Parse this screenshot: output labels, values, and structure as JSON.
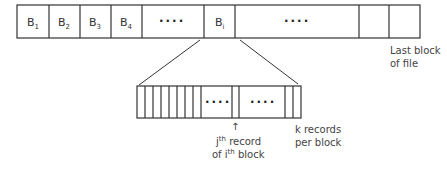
{
  "file_blocks": {
    "cells": [
      {
        "x": 17,
        "w": 32,
        "label": "B",
        "sub": "1"
      },
      {
        "x": 49,
        "w": 31,
        "label": "B",
        "sub": "2"
      },
      {
        "x": 80,
        "w": 31,
        "label": "B",
        "sub": "3"
      },
      {
        "x": 111,
        "w": 31,
        "label": "B",
        "sub": "4"
      },
      {
        "x": 142,
        "w": 62,
        "label": "····",
        "sub": ""
      },
      {
        "x": 204,
        "w": 31,
        "label": "B",
        "sub": "i"
      },
      {
        "x": 235,
        "w": 124,
        "label": "····",
        "sub": ""
      },
      {
        "x": 359,
        "w": 30,
        "label": "",
        "sub": ""
      },
      {
        "x": 389,
        "w": 31,
        "label": "",
        "sub": ""
      }
    ],
    "last_block_label_line1": "Last block",
    "last_block_label_line2": "of file"
  },
  "record_block": {
    "record_label_line1_pre": "j",
    "record_label_line1_sup": "th",
    "record_label_line1_post": " record",
    "record_label_line2_pre": "of i",
    "record_label_line2_sup": "th",
    "record_label_line2_post": " block",
    "k_label_line1": "k records",
    "k_label_line2": "per block",
    "dots": "····",
    "arrow": "↑"
  }
}
